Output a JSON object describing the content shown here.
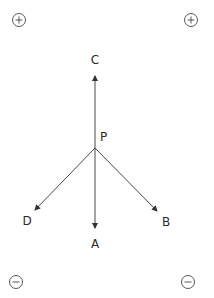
{
  "diagram": {
    "type": "force-vector-diagram",
    "origin": {
      "label": "P",
      "x": 95,
      "y": 148
    },
    "colors": {
      "line": "#333333",
      "text": "#2a2a2a",
      "background": "#ffffff"
    },
    "vectors": [
      {
        "label": "C",
        "direction": "up",
        "tip": {
          "x": 95,
          "y": 75
        },
        "label_pos": {
          "x": 95,
          "y": 64
        }
      },
      {
        "label": "D",
        "direction": "down-left",
        "tip": {
          "x": 34,
          "y": 211
        },
        "label_pos": {
          "x": 27,
          "y": 224
        }
      },
      {
        "label": "A",
        "direction": "down",
        "tip": {
          "x": 95,
          "y": 229
        },
        "label_pos": {
          "x": 95,
          "y": 247
        }
      },
      {
        "label": "B",
        "direction": "down-right",
        "tip": {
          "x": 158,
          "y": 212
        },
        "label_pos": {
          "x": 166,
          "y": 225
        }
      }
    ],
    "charges": [
      {
        "sign": "+",
        "name": "positive-charge-top-left",
        "x": 19,
        "y": 20
      },
      {
        "sign": "+",
        "name": "positive-charge-top-right",
        "x": 191,
        "y": 20
      },
      {
        "sign": "-",
        "name": "negative-charge-bottom-left",
        "x": 16,
        "y": 282
      },
      {
        "sign": "-",
        "name": "negative-charge-bottom-right",
        "x": 188,
        "y": 282
      }
    ],
    "labels": {
      "point": "P",
      "c": "C",
      "d": "D",
      "a": "A",
      "b": "B"
    }
  }
}
